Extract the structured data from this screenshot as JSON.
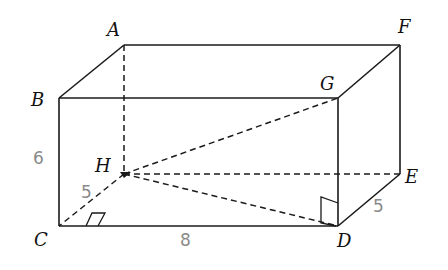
{
  "figure": {
    "type": "rectangular prism (cuboid) with space diagonals",
    "vertices": {
      "A": {
        "label": "A",
        "x": 124,
        "y": 45
      },
      "F": {
        "label": "F",
        "x": 400,
        "y": 45
      },
      "B": {
        "label": "B",
        "x": 59,
        "y": 98
      },
      "G": {
        "label": "G",
        "x": 338,
        "y": 98
      },
      "H": {
        "label": "H",
        "x": 124,
        "y": 174
      },
      "E": {
        "label": "E",
        "x": 400,
        "y": 174
      },
      "C": {
        "label": "C",
        "x": 59,
        "y": 226
      },
      "D": {
        "label": "D",
        "x": 338,
        "y": 226
      }
    },
    "solid_edges": [
      "AF",
      "AB",
      "FG",
      "BG",
      "BC",
      "GD",
      "FE",
      "ED",
      "CD"
    ],
    "dashed_edges": [
      "AH",
      "HC",
      "HE",
      "HG",
      "HD"
    ],
    "right_angles": [
      "HCD",
      "HDG"
    ],
    "handwritten_measures": {
      "height_BC": "6",
      "depth_CH": "5",
      "length_CD": "8",
      "depth_DE": "5"
    },
    "colors": {
      "lines": "#1a1a1a",
      "handwriting": "#8a8a8a",
      "background": "#ffffff"
    }
  }
}
